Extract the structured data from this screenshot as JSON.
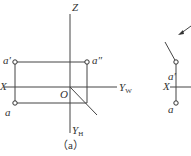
{
  "figure_a": {
    "caption": "（a）",
    "labels": {
      "z": "Z",
      "a_prime": "a′",
      "a_double_prime": "a″",
      "x": "X",
      "origin": "O",
      "yw": "Y",
      "yw_sub": "W",
      "a": "a",
      "yh": "Y",
      "yh_sub": "H"
    }
  },
  "figure_b_partial": {
    "labels": {
      "a_prime": "a′",
      "x": "X",
      "a": "a"
    }
  },
  "colors": {
    "line": "#444444",
    "text": "#333333"
  }
}
